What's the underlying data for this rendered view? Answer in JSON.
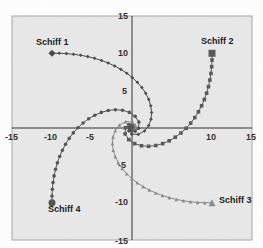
{
  "chart_data": {
    "type": "scatter",
    "title": "",
    "xlabel": "",
    "ylabel": "",
    "xlim": [
      -15,
      15
    ],
    "ylim": [
      -15,
      15
    ],
    "grid": false,
    "legend": "none",
    "x_ticks": [
      "-15",
      "-10",
      "-5",
      "10",
      "15"
    ],
    "y_ticks": [
      "15",
      "10",
      "5",
      "-5",
      "-10",
      "-15"
    ],
    "series": [
      {
        "name": "Schiff 1",
        "start": [
          -10,
          10
        ],
        "marker": "diamond",
        "color": "#4a4a4a",
        "pursues": "Schiff 2"
      },
      {
        "name": "Schiff 2",
        "start": [
          10,
          10
        ],
        "marker": "square",
        "color": "#5a5a5a",
        "pursues": "Schiff 3"
      },
      {
        "name": "Schiff 3",
        "start": [
          10,
          -10
        ],
        "marker": "triangle",
        "color": "#8a8a8a",
        "pursues": "Schiff 4"
      },
      {
        "name": "Schiff 4",
        "start": [
          -10,
          -10
        ],
        "marker": "circle",
        "color": "#555555",
        "pursues": "Schiff 1"
      }
    ],
    "annotations": [
      "Schiff 1",
      "Schiff 2",
      "Schiff 3",
      "Schiff 4"
    ],
    "curve": "pursuit spiral converging to (0,0)",
    "steps": 30,
    "step_size": 0.9
  },
  "labels": {
    "s1": "Schiff 1",
    "s2": "Schiff 2",
    "s3": "Schiff 3",
    "s4": "Schiff 4"
  },
  "ticks": {
    "xm15": "-15",
    "xm10": "-10",
    "xm5": "-5",
    "x10": "10",
    "x15": "15",
    "y15": "15",
    "y10": "10",
    "y5": "5",
    "ym5": "-5",
    "ym10": "-10",
    "ym15": "-15"
  }
}
